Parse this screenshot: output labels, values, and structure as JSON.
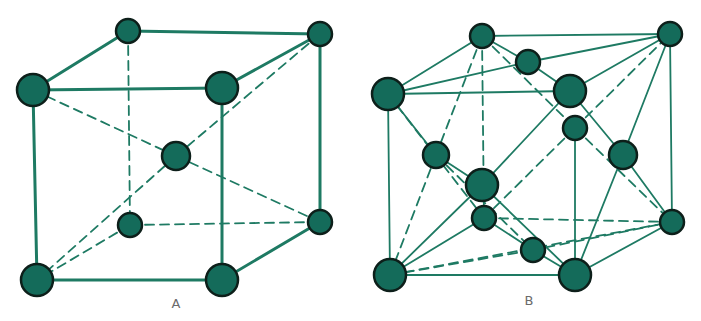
{
  "colors": {
    "atom_fill": "#146b5a",
    "atom_stroke": "#0d1f1a",
    "edge": "#1e7a63",
    "label": "#6b6b6b"
  },
  "diagrams": [
    {
      "id": "A",
      "label": "A",
      "label_pos": [
        176,
        308
      ],
      "nodes": [
        {
          "id": "btl",
          "x": 128,
          "y": 31,
          "r": 12
        },
        {
          "id": "btr",
          "x": 320,
          "y": 34,
          "r": 12
        },
        {
          "id": "ftl",
          "x": 33,
          "y": 90,
          "r": 16
        },
        {
          "id": "ftr",
          "x": 222,
          "y": 88,
          "r": 16
        },
        {
          "id": "c",
          "x": 176,
          "y": 156,
          "r": 14
        },
        {
          "id": "bbl",
          "x": 130,
          "y": 225,
          "r": 12
        },
        {
          "id": "bbr",
          "x": 320,
          "y": 222,
          "r": 12
        },
        {
          "id": "fbl",
          "x": 37,
          "y": 280,
          "r": 16
        },
        {
          "id": "fbr",
          "x": 222,
          "y": 280,
          "r": 16
        }
      ],
      "edges": [
        [
          "btl",
          "btr",
          "solid"
        ],
        [
          "btl",
          "ftl",
          "solid"
        ],
        [
          "ftl",
          "ftr",
          "solid"
        ],
        [
          "ftr",
          "btr",
          "solid"
        ],
        [
          "btr",
          "bbr",
          "solid"
        ],
        [
          "ftl",
          "fbl",
          "solid"
        ],
        [
          "ftr",
          "fbr",
          "solid"
        ],
        [
          "fbl",
          "fbr",
          "solid"
        ],
        [
          "fbr",
          "bbr",
          "solid"
        ],
        [
          "btl",
          "bbl",
          "dashed"
        ],
        [
          "bbl",
          "bbr",
          "dashed"
        ],
        [
          "bbl",
          "fbl",
          "dashed"
        ],
        [
          "ftl",
          "c",
          "dashed"
        ],
        [
          "c",
          "bbr",
          "dashed"
        ],
        [
          "btr",
          "c",
          "dashed"
        ],
        [
          "c",
          "fbl",
          "dashed"
        ]
      ]
    },
    {
      "id": "B",
      "label": "B",
      "label_pos": [
        529,
        305
      ],
      "nodes": [
        {
          "id": "btl",
          "x": 482,
          "y": 36,
          "r": 12
        },
        {
          "id": "btr",
          "x": 670,
          "y": 34,
          "r": 12
        },
        {
          "id": "topc",
          "x": 528,
          "y": 62,
          "r": 12
        },
        {
          "id": "ftl",
          "x": 388,
          "y": 94,
          "r": 16
        },
        {
          "id": "ftr",
          "x": 570,
          "y": 91,
          "r": 16
        },
        {
          "id": "rbc",
          "x": 575,
          "y": 128,
          "r": 12
        },
        {
          "id": "leftc",
          "x": 436,
          "y": 155,
          "r": 13
        },
        {
          "id": "rightc",
          "x": 623,
          "y": 155,
          "r": 14
        },
        {
          "id": "frontc",
          "x": 482,
          "y": 185,
          "r": 16
        },
        {
          "id": "backc",
          "x": 484,
          "y": 218,
          "r": 12
        },
        {
          "id": "bbr",
          "x": 672,
          "y": 222,
          "r": 12
        },
        {
          "id": "botc",
          "x": 533,
          "y": 250,
          "r": 12
        },
        {
          "id": "fbl",
          "x": 390,
          "y": 275,
          "r": 16
        },
        {
          "id": "fbr",
          "x": 575,
          "y": 275,
          "r": 16
        }
      ],
      "edges": [
        [
          "btl",
          "btr",
          "solid"
        ],
        [
          "btl",
          "ftl",
          "solid"
        ],
        [
          "ftl",
          "ftr",
          "solid"
        ],
        [
          "ftr",
          "btr",
          "solid"
        ],
        [
          "btr",
          "bbr",
          "solid"
        ],
        [
          "ftl",
          "fbl",
          "solid"
        ],
        [
          "fbl",
          "fbr",
          "solid"
        ],
        [
          "fbr",
          "bbr",
          "solid"
        ],
        [
          "ftl",
          "topc",
          "solid"
        ],
        [
          "topc",
          "btr",
          "solid"
        ],
        [
          "btl",
          "topc",
          "solid"
        ],
        [
          "topc",
          "ftr",
          "solid"
        ],
        [
          "ftl",
          "leftc",
          "solid"
        ],
        [
          "leftc",
          "frontc",
          "solid"
        ],
        [
          "frontc",
          "fbr",
          "solid"
        ],
        [
          "ftr",
          "frontc",
          "solid"
        ],
        [
          "frontc",
          "fbl",
          "solid"
        ],
        [
          "btr",
          "rightc",
          "solid"
        ],
        [
          "rightc",
          "fbr",
          "solid"
        ],
        [
          "ftr",
          "rightc",
          "solid"
        ],
        [
          "rightc",
          "bbr",
          "solid"
        ],
        [
          "rbc",
          "fbr",
          "solid"
        ],
        [
          "fbl",
          "backc",
          "solid"
        ],
        [
          "backc",
          "botc",
          "solid"
        ],
        [
          "botc",
          "fbr",
          "solid"
        ],
        [
          "bbr",
          "botc",
          "dashed"
        ],
        [
          "btl",
          "bbl_virtual",
          "none"
        ],
        [
          "btl",
          "backc",
          "dashed"
        ],
        [
          "btl",
          "leftc",
          "dashed"
        ],
        [
          "leftc",
          "fbl",
          "dashed"
        ],
        [
          "btl",
          "rbc",
          "dashed"
        ],
        [
          "rbc",
          "btr",
          "dashed"
        ],
        [
          "rbc",
          "bbr",
          "dashed"
        ],
        [
          "rbc",
          "backc",
          "dashed"
        ],
        [
          "ftl",
          "backc",
          "dashed"
        ],
        [
          "backc",
          "bbr",
          "dashed"
        ],
        [
          "fbl",
          "botc",
          "dashed"
        ],
        [
          "fbl",
          "bbr",
          "dashed"
        ],
        [
          "leftc",
          "botc",
          "dashed"
        ]
      ]
    }
  ]
}
